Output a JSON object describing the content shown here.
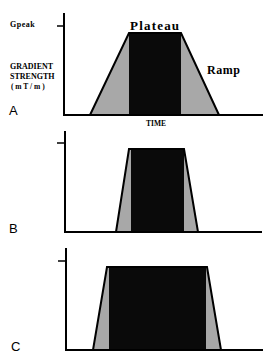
{
  "figure": {
    "y_axis_label_lines": [
      "GRADIENT",
      "STRENGTH",
      "( m T / m )"
    ],
    "x_axis_label": "TIME",
    "peak_label": "Gpeak",
    "plateau_label": "Plateau",
    "ramp_label": "Ramp",
    "colors": {
      "plateau": "#0a0a0a",
      "ramp": "#a8a8a8",
      "axis": "#000000"
    },
    "panels": [
      {
        "letter": "A",
        "description": "Trapezoidal gradient pulse with long ramps and short plateau"
      },
      {
        "letter": "B",
        "description": "Short pulse with steep ramps"
      },
      {
        "letter": "C",
        "description": "Longer plateau with steep ramps"
      }
    ]
  }
}
